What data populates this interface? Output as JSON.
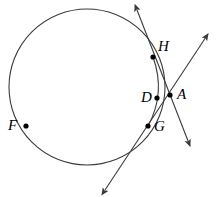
{
  "diagram": {
    "canvas": {
      "width": 216,
      "height": 197
    },
    "stroke_color": "#3a3a3a",
    "point_color": "#000000",
    "label_color": "#000000",
    "background_color": "#ffffff",
    "circle": {
      "name": "main-circle",
      "cx": 87,
      "cy": 87,
      "r": 78,
      "stroke_width": 1.1,
      "fill": "none"
    },
    "points": [
      {
        "id": "H",
        "label": "H",
        "x": 153,
        "y": 57,
        "label_x": 158,
        "label_y": 39,
        "dot_r": 2.6
      },
      {
        "id": "A",
        "label": "A",
        "x": 170,
        "y": 95,
        "label_x": 177,
        "label_y": 87,
        "dot_r": 2.6
      },
      {
        "id": "D",
        "label": "D",
        "x": 157,
        "y": 98,
        "label_x": 141,
        "label_y": 90,
        "dot_r": 2.6
      },
      {
        "id": "G",
        "label": "G",
        "x": 148,
        "y": 126,
        "label_x": 154,
        "label_y": 119,
        "dot_r": 2.6
      },
      {
        "id": "F",
        "label": "F",
        "x": 26,
        "y": 126,
        "label_x": 8,
        "label_y": 118,
        "dot_r": 2.6
      }
    ],
    "lines": [
      {
        "name": "tangent-line-through-H-and-A",
        "from": {
          "x": 137,
          "y": 10
        },
        "to": {
          "x": 190,
          "y": 146
        },
        "arrow_start": true,
        "arrow_end": true,
        "stroke_width": 1.1
      },
      {
        "name": "secant-line-through-G-and-A",
        "from": {
          "x": 105,
          "y": 190
        },
        "to": {
          "x": 208,
          "y": 34
        },
        "arrow_start": true,
        "arrow_end": true,
        "stroke_width": 1.1
      }
    ],
    "chord_arc": {
      "name": "chord-H-to-G",
      "from": {
        "x": 153,
        "y": 57
      },
      "to": {
        "x": 148,
        "y": 126
      },
      "control": {
        "x": 166,
        "y": 93
      },
      "stroke_width": 1.1
    }
  }
}
